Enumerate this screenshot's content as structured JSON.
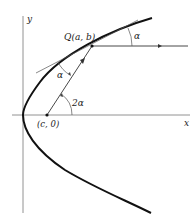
{
  "diagram": {
    "axes": {
      "x_label": "x",
      "y_label": "y"
    },
    "points": {
      "Q": {
        "label": "Q(a, b)"
      },
      "focus": {
        "label": "(c, 0)"
      }
    },
    "angles": {
      "incident": "α",
      "reflected": "α",
      "focal": "2α"
    },
    "colors": {
      "ink": "#222222",
      "curve": "#111111",
      "thin": "#555555"
    }
  }
}
